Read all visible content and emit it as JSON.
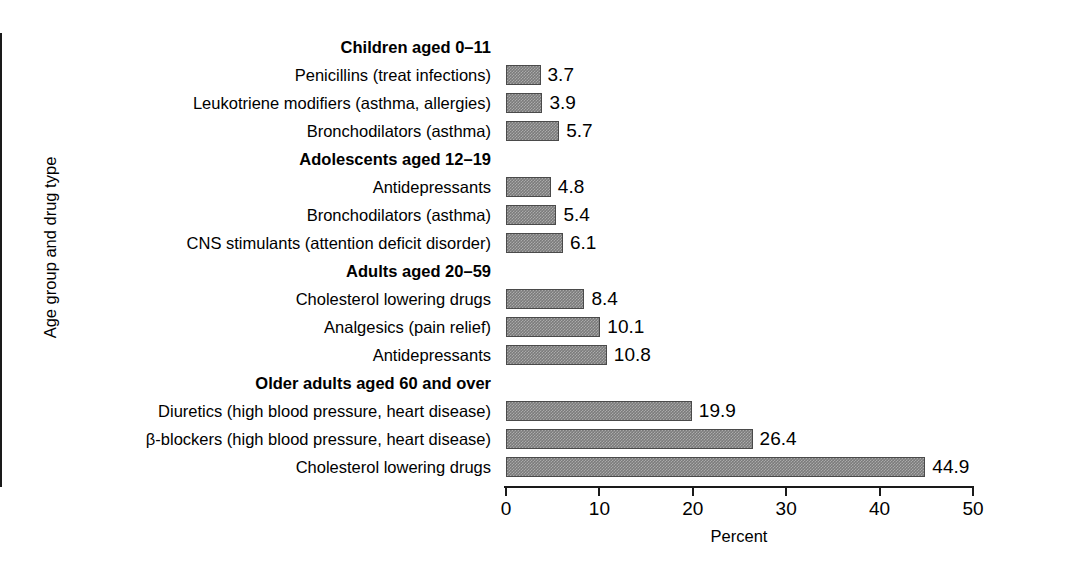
{
  "chart_data": {
    "type": "bar",
    "orientation": "horizontal",
    "title": "",
    "xlabel": "Percent",
    "ylabel": "Age group and drug type",
    "xlim": [
      0,
      50
    ],
    "xticks": [
      "0",
      "10",
      "20",
      "30",
      "40",
      "50"
    ],
    "grid": false,
    "legend": null,
    "categories": [
      "Children aged 0–11",
      "Penicillins (treat infections)",
      "Leukotriene modifiers (asthma, allergies)",
      "Bronchodilators (asthma)",
      "Adolescents aged 12–19",
      "Antidepressants",
      "Bronchodilators (asthma)",
      "CNS stimulants (attention deficit disorder)",
      "Adults aged 20–59",
      "Cholesterol lowering drugs",
      "Analgesics (pain relief)",
      "Antidepressants",
      "Older adults aged 60 and over",
      "Diuretics (high blood pressure, heart disease)",
      "β-blockers (high blood pressure, heart disease)",
      "Cholesterol lowering drugs"
    ],
    "values": [
      null,
      3.7,
      3.9,
      5.7,
      null,
      4.8,
      5.4,
      6.1,
      null,
      8.4,
      10.1,
      10.8,
      null,
      19.9,
      26.4,
      44.9
    ],
    "value_labels": [
      "",
      "3.7",
      "3.9",
      "5.7",
      "",
      "4.8",
      "5.4",
      "6.1",
      "",
      "8.4",
      "10.1",
      "10.8",
      "",
      "19.9",
      "26.4",
      "44.9"
    ],
    "groups": [
      {
        "header": "Children aged 0–11",
        "items": [
          {
            "label": "Penicillins (treat infections)",
            "value": 3.7,
            "value_label": "3.7"
          },
          {
            "label": "Leukotriene modifiers (asthma, allergies)",
            "value": 3.9,
            "value_label": "3.9"
          },
          {
            "label": "Bronchodilators (asthma)",
            "value": 5.7,
            "value_label": "5.7"
          }
        ]
      },
      {
        "header": "Adolescents aged 12–19",
        "items": [
          {
            "label": "Antidepressants",
            "value": 4.8,
            "value_label": "4.8"
          },
          {
            "label": "Bronchodilators (asthma)",
            "value": 5.4,
            "value_label": "5.4"
          },
          {
            "label": "CNS stimulants (attention deficit disorder)",
            "value": 6.1,
            "value_label": "6.1"
          }
        ]
      },
      {
        "header": "Adults aged 20–59",
        "items": [
          {
            "label": "Cholesterol lowering drugs",
            "value": 8.4,
            "value_label": "8.4"
          },
          {
            "label": "Analgesics (pain relief)",
            "value": 10.1,
            "value_label": "10.1"
          },
          {
            "label": "Antidepressants",
            "value": 10.8,
            "value_label": "10.8"
          }
        ]
      },
      {
        "header": "Older adults aged 60 and over",
        "items": [
          {
            "label": "Diuretics (high blood pressure, heart disease)",
            "value": 19.9,
            "value_label": "19.9"
          },
          {
            "label": "β-blockers (high blood pressure, heart disease)",
            "value": 26.4,
            "value_label": "26.4"
          },
          {
            "label": "Cholesterol lowering drugs",
            "value": 44.9,
            "value_label": "44.9"
          }
        ]
      }
    ],
    "colors": {
      "bar_fill": "#7b7b7b",
      "bar_edge": "#4a4a4a",
      "axis": "#1a1a1a",
      "text": "#000000",
      "background": "#ffffff"
    }
  }
}
